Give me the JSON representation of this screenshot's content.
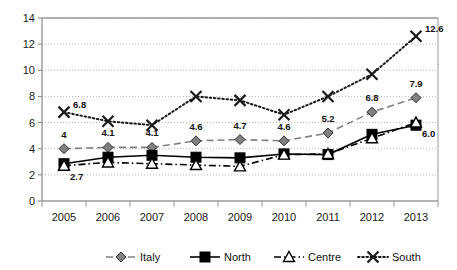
{
  "chart_data": {
    "type": "line",
    "title": "",
    "xlabel": "",
    "ylabel": "",
    "categories": [
      "2005",
      "2006",
      "2007",
      "2008",
      "2009",
      "2010",
      "2011",
      "2012",
      "2013"
    ],
    "ylim": [
      0,
      14
    ],
    "ytick_step": 2,
    "yticks": [
      "0",
      "2",
      "4",
      "6",
      "8",
      "10",
      "12",
      "14"
    ],
    "grid": true,
    "legend_position": "bottom",
    "series": [
      {
        "name": "Italy",
        "marker": "diamond",
        "line_style": "dashed",
        "color": "#808080",
        "values": [
          4,
          4.1,
          4.1,
          4.6,
          4.7,
          4.6,
          5.2,
          6.8,
          7.9
        ],
        "labels": [
          "4",
          "4.1",
          "4.1",
          "4.6",
          "4.7",
          "4.6",
          "5.2",
          "6.8",
          "7.9"
        ]
      },
      {
        "name": "North",
        "marker": "square",
        "line_style": "solid",
        "color": "#000000",
        "values": [
          2.85,
          3.35,
          3.5,
          3.35,
          3.3,
          3.6,
          3.55,
          5.1,
          5.8
        ],
        "labels": [
          "",
          "",
          "",
          "",
          "",
          "",
          "",
          "",
          ""
        ]
      },
      {
        "name": "Centre",
        "marker": "triangle",
        "line_style": "dashdot",
        "color": "#000000",
        "values": [
          2.7,
          2.95,
          2.85,
          2.75,
          2.65,
          3.55,
          3.6,
          4.8,
          6.0
        ],
        "labels": [
          "2.7",
          "",
          "",
          "",
          "",
          "",
          "",
          "",
          "6.0"
        ]
      },
      {
        "name": "South",
        "marker": "x",
        "line_style": "dotted",
        "color": "#1a1a1a",
        "values": [
          6.8,
          6.1,
          5.8,
          8.0,
          7.7,
          6.6,
          8.0,
          9.7,
          12.6
        ],
        "labels": [
          "6.8",
          "",
          "",
          "",
          "",
          "",
          "",
          "",
          "12.6"
        ]
      }
    ]
  },
  "legend": {
    "items": [
      {
        "label": "Italy"
      },
      {
        "label": "North"
      },
      {
        "label": "Centre"
      },
      {
        "label": "South"
      }
    ]
  }
}
